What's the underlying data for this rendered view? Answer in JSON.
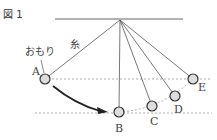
{
  "figure": {
    "title": "図 1",
    "labels": {
      "weight": "おもり",
      "string": "糸"
    },
    "points": [
      {
        "id": "A",
        "label": "A",
        "x": 45,
        "y": 79
      },
      {
        "id": "B",
        "label": "B",
        "x": 119,
        "y": 112
      },
      {
        "id": "C",
        "label": "C",
        "x": 152,
        "y": 106
      },
      {
        "id": "D",
        "label": "D",
        "x": 175,
        "y": 96
      },
      {
        "id": "E",
        "label": "E",
        "x": 193,
        "y": 79
      }
    ],
    "pivot": {
      "x": 120,
      "y": 20
    },
    "colors": {
      "line": "#555555",
      "dashed": "#888888",
      "arrow": "#222222"
    }
  }
}
